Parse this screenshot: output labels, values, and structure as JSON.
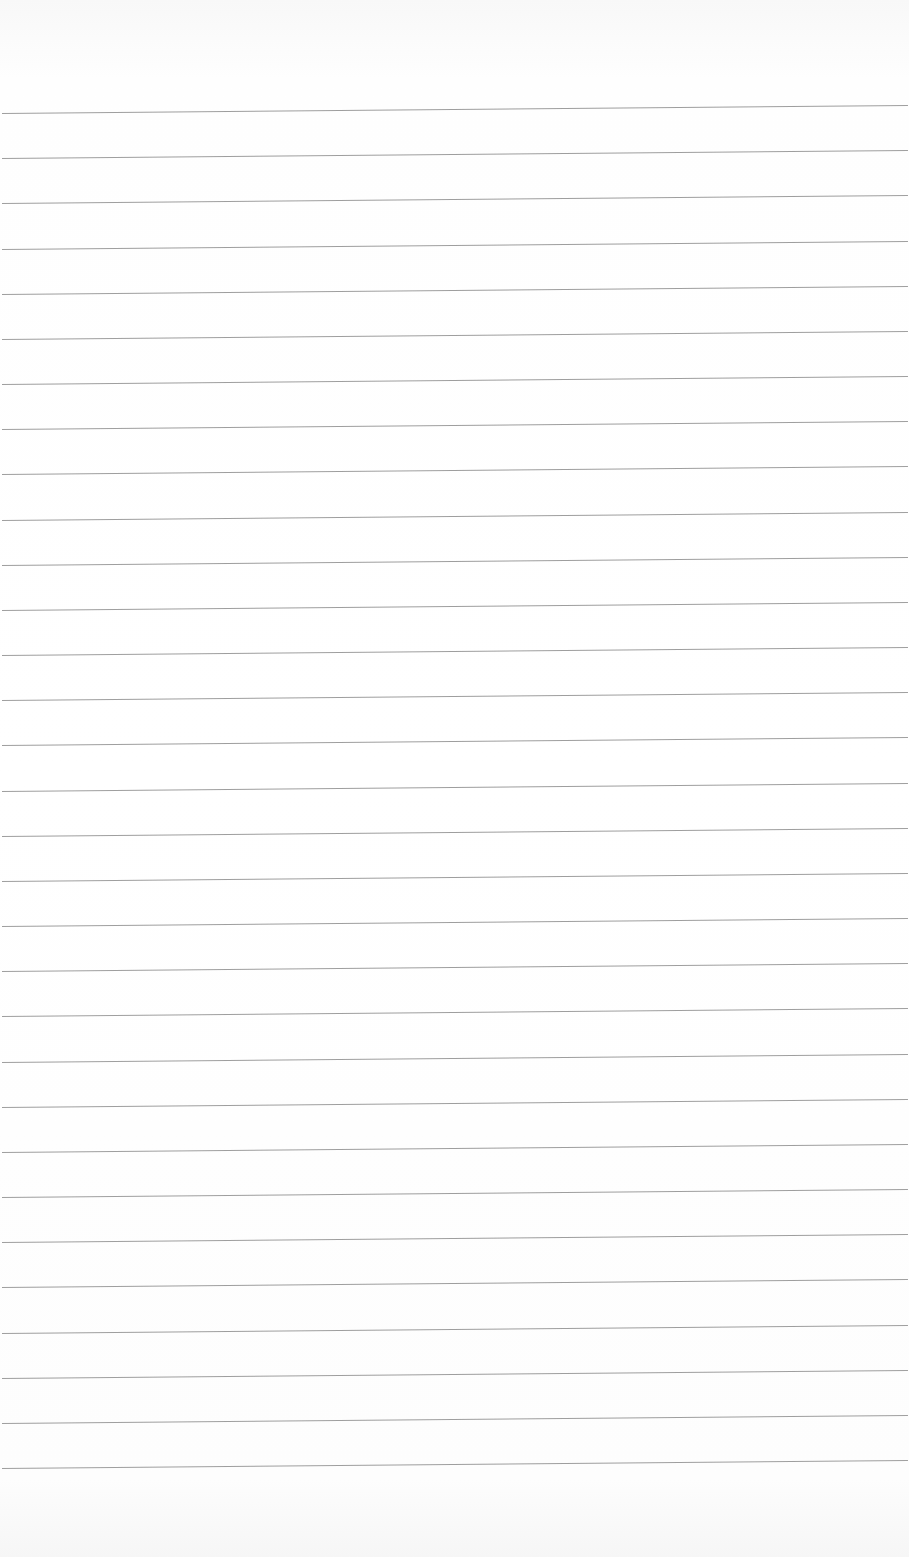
{
  "page": {
    "type": "lined-paper",
    "line_count": 31,
    "first_line_y": 113,
    "line_spacing": 45.17,
    "line_color": "#8d8d8d",
    "background_color": "#fdfdfd"
  }
}
